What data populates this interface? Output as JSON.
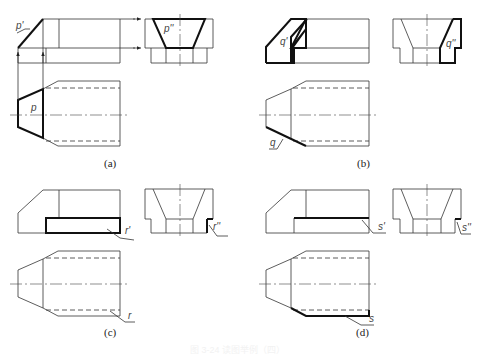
{
  "panels": [
    {
      "id": "a",
      "caption": "(a)",
      "labels": {
        "front": "p'",
        "side": "p''",
        "top": "p"
      }
    },
    {
      "id": "b",
      "caption": "(b)",
      "labels": {
        "front": "q'",
        "side": "q''",
        "top": "q"
      }
    },
    {
      "id": "c",
      "caption": "(c)",
      "labels": {
        "front": "r'",
        "side": "r''",
        "top": "r"
      }
    },
    {
      "id": "d",
      "caption": "(d)",
      "labels": {
        "front": "s'",
        "side": "s''",
        "top": "s"
      }
    }
  ],
  "figure_caption": "图 3-24  读图举例（四）"
}
